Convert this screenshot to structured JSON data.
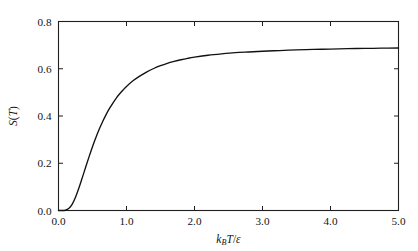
{
  "chart_data": {
    "type": "line",
    "title": "",
    "subtitle": "",
    "xlabel": "k_B T / ε",
    "ylabel": "S(T)",
    "xlabel_parts": {
      "k": "k",
      "sub": "B",
      "T": "T",
      "slash": "/",
      "eps": "ε"
    },
    "ylabel_parts": {
      "S": "S",
      "open": "(",
      "T": "T",
      "close": ")"
    },
    "xlim": [
      0.0,
      5.0
    ],
    "ylim": [
      0.0,
      0.8
    ],
    "xticks": [
      0.0,
      1.0,
      2.0,
      3.0,
      4.0,
      5.0
    ],
    "yticks": [
      0.0,
      0.2,
      0.4,
      0.6,
      0.8
    ],
    "xticklabels": [
      "0.0",
      "1.0",
      "2.0",
      "3.0",
      "4.0",
      "5.0"
    ],
    "yticklabels": [
      "0.0",
      "0.2",
      "0.4",
      "0.6",
      "0.8"
    ],
    "grid": false,
    "legend": null,
    "frame": "box",
    "tick_direction": "in",
    "line_color": "#111111",
    "series": [
      {
        "name": "S(T)",
        "x": [
          0.0,
          0.05,
          0.1,
          0.15,
          0.2,
          0.25,
          0.3,
          0.35,
          0.4,
          0.45,
          0.5,
          0.55,
          0.6,
          0.65,
          0.7,
          0.75,
          0.8,
          0.85,
          0.9,
          0.95,
          1.0,
          1.1,
          1.2,
          1.3,
          1.4,
          1.5,
          1.6,
          1.7,
          1.8,
          1.9,
          2.0,
          2.2,
          2.4,
          2.6,
          2.8,
          3.0,
          3.25,
          3.5,
          3.75,
          4.0,
          4.25,
          4.5,
          4.75,
          5.0
        ],
        "y": [
          0.0,
          0.0,
          0.001,
          0.008,
          0.026,
          0.056,
          0.095,
          0.139,
          0.184,
          0.228,
          0.27,
          0.309,
          0.345,
          0.377,
          0.406,
          0.432,
          0.455,
          0.476,
          0.494,
          0.51,
          0.525,
          0.55,
          0.57,
          0.587,
          0.601,
          0.613,
          0.623,
          0.631,
          0.638,
          0.644,
          0.649,
          0.657,
          0.663,
          0.668,
          0.671,
          0.674,
          0.677,
          0.68,
          0.682,
          0.683,
          0.685,
          0.686,
          0.687,
          0.688
        ]
      }
    ],
    "asymptote": 0.693,
    "annotations": []
  },
  "figure": {
    "background": "#ffffff",
    "width": 418,
    "height": 251
  }
}
